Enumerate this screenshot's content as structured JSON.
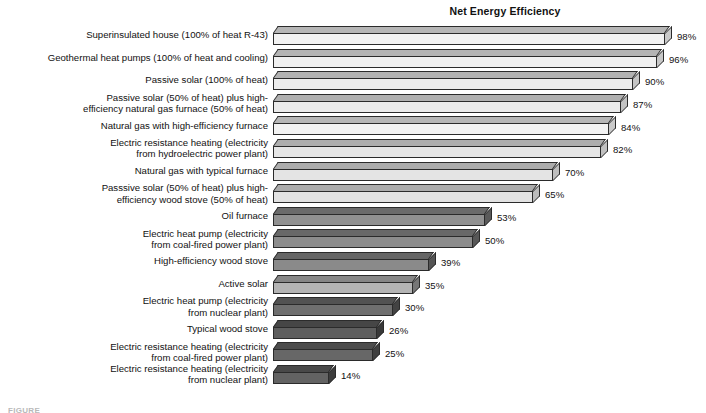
{
  "chart_data": {
    "type": "bar",
    "title": "Net Energy Efficiency",
    "xlabel": "",
    "ylabel": "",
    "orientation": "horizontal",
    "grid": false,
    "legend": null,
    "xlim": [
      0,
      100
    ],
    "value_suffix": "%",
    "categories": [
      "Superinsulated house (100% of heat R-43)",
      "Geothermal heat pumps (100% of heat and cooling)",
      "Passive solar (100% of heat)",
      "Passive solar (50% of heat) plus high-\nefficiency natural gas furnace (50% of heat)",
      "Natural gas with high-efficiency furnace",
      "Electric resistance heating (electricity\nfrom hydroelectric power plant)",
      "Natural gas with typical furnace",
      "Passsive solar (50% of heat) plus high-\nefficiency wood stove (50% of heat)",
      "Oil furnace",
      "Electric heat pump (electricity\nfrom coal-fired power plant)",
      "High-efficiency wood stove",
      "Active solar",
      "Electric heat pump (electricity\nfrom nuclear plant)",
      "Typical wood stove",
      "Electric resistance heating (electricity\nfrom coal-fired power plant)",
      "Electric resistance heating (electricity\nfrom nuclear plant)"
    ],
    "values": [
      98,
      96,
      90,
      87,
      84,
      82,
      70,
      65,
      53,
      50,
      39,
      35,
      30,
      26,
      25,
      14
    ],
    "value_labels": [
      "98%",
      "96%",
      "90%",
      "87%",
      "84%",
      "82%",
      "70%",
      "65%",
      "53%",
      "50%",
      "39%",
      "35%",
      "30%",
      "26%",
      "25%",
      "14%"
    ],
    "bar_face_colors": [
      "#f2f2f2",
      "#f0f0f0",
      "#ededed",
      "#ebebeb",
      "#f2f2f2",
      "#e6e6e6",
      "#e4e4e4",
      "#e2e2e2",
      "#919191",
      "#8c8c8c",
      "#8a8a8a",
      "#b4b4b4",
      "#6f6f6f",
      "#5e5e5e",
      "#676767",
      "#636363"
    ],
    "bar_top_colors": [
      "#b6b6b6",
      "#b4b4b4",
      "#b2b2b2",
      "#b0b0b0",
      "#b6b6b6",
      "#aeaeae",
      "#acacac",
      "#ababab",
      "#6b6b6b",
      "#686868",
      "#666666",
      "#868686",
      "#525252",
      "#464646",
      "#4c4c4c",
      "#494949"
    ],
    "bar_side_colors": [
      "#c9c9c9",
      "#c7c7c7",
      "#c5c5c5",
      "#c3c3c3",
      "#c9c9c9",
      "#c0c0c0",
      "#bebebe",
      "#bcbcbc",
      "#5a5a5a",
      "#575757",
      "#555555",
      "#757575",
      "#434343",
      "#393939",
      "#3f3f3f",
      "#3c3c3c"
    ]
  },
  "figure": {
    "caption": "FIGURE"
  },
  "colors": {
    "background": "#ffffff",
    "text": "#111111",
    "outline": "#2b2b2b"
  }
}
